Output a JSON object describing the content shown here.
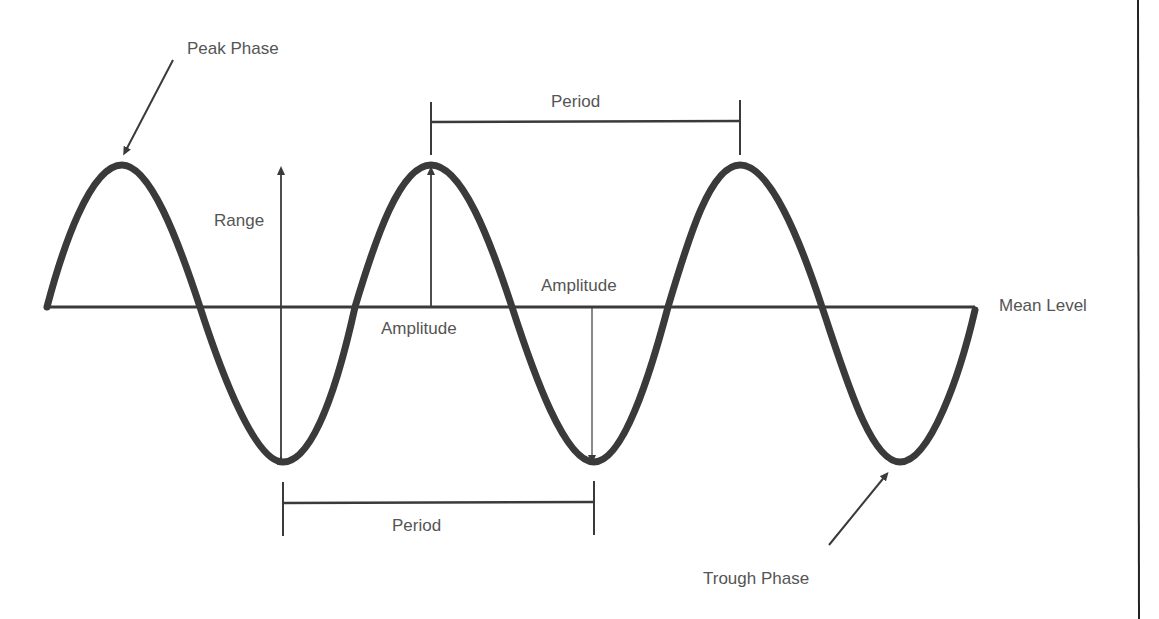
{
  "diagram": {
    "colors": {
      "background": "#ffffff",
      "wave": "#3a3a3a",
      "lines": "#3a3a3a",
      "text": "#555555"
    },
    "labels": {
      "peak_phase": "Peak Phase",
      "trough_phase": "Trough Phase",
      "range": "Range",
      "period_top": "Period",
      "period_bottom": "Period",
      "amplitude_upper": "Amplitude",
      "amplitude_lower": "Amplitude",
      "mean_level": "Mean Level"
    },
    "wave": {
      "mean_level_y": 307,
      "peak_y": 165,
      "trough_y": 462,
      "peaks_x": [
        122,
        431,
        740
      ],
      "troughs_x": [
        283,
        594,
        900
      ],
      "start_x": 45,
      "end_x": 975
    }
  }
}
